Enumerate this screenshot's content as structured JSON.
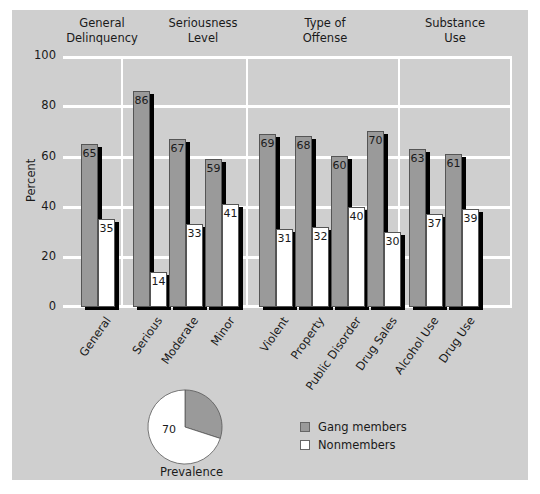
{
  "chart_data": {
    "type": "bar",
    "title": "",
    "xlabel": "",
    "ylabel": "Percent",
    "ylim": [
      0,
      100
    ],
    "yticks": [
      0,
      20,
      40,
      60,
      80,
      100
    ],
    "grid": true,
    "groups": [
      {
        "title": "General Delinquency",
        "title_lines": [
          "General",
          "Delinquency"
        ],
        "categories": [
          "General"
        ]
      },
      {
        "title": "Seriousness Level",
        "title_lines": [
          "Seriousness",
          "Level"
        ],
        "categories": [
          "Serious",
          "Moderate",
          "Minor"
        ]
      },
      {
        "title": "Type of Offense",
        "title_lines": [
          "Type of",
          "Offense"
        ],
        "categories": [
          "Violent",
          "Property",
          "Public Disorder",
          "Drug Sales"
        ]
      },
      {
        "title": "Substance Use",
        "title_lines": [
          "Substance",
          "Use"
        ],
        "categories": [
          "Alcohol Use",
          "Drug Use"
        ]
      }
    ],
    "categories": [
      "General",
      "Serious",
      "Moderate",
      "Minor",
      "Violent",
      "Property",
      "Public Disorder",
      "Drug Sales",
      "Alcohol Use",
      "Drug Use"
    ],
    "series": [
      {
        "name": "Gang members",
        "color": "#9a9a9a",
        "values": [
          65,
          86,
          67,
          59,
          69,
          68,
          60,
          70,
          63,
          61
        ]
      },
      {
        "name": "Nonmembers",
        "color": "#ffffff",
        "values": [
          35,
          14,
          33,
          41,
          31,
          32,
          40,
          30,
          37,
          39
        ]
      }
    ],
    "legend": {
      "position": "bottom-right",
      "entries": [
        "Gang members",
        "Nonmembers"
      ]
    },
    "inset_pie": {
      "type": "pie",
      "caption": "Prevalence",
      "slices": [
        {
          "name": "Gang members",
          "value": 30,
          "color": "#9a9a9a",
          "label": ""
        },
        {
          "name": "Nonmembers",
          "value": 70,
          "color": "#ffffff",
          "label": "70"
        }
      ]
    }
  },
  "labels": {
    "ylabel": "Percent",
    "yticks": [
      "0",
      "20",
      "40",
      "60",
      "80",
      "100"
    ],
    "group_titles": [
      [
        "General",
        "Delinquency"
      ],
      [
        "Seriousness",
        "Level"
      ],
      [
        "Type of",
        "Offense"
      ],
      [
        "Substance",
        "Use"
      ]
    ],
    "pie_caption": "Prevalence",
    "pie_value_label": "70",
    "legend": [
      "Gang members",
      "Nonmembers"
    ]
  }
}
